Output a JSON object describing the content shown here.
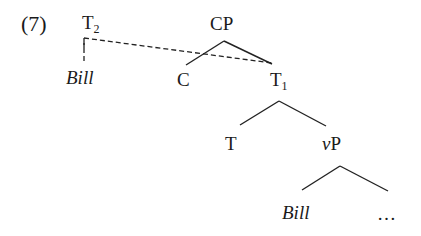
{
  "example_number": "(7)",
  "nodes": {
    "t2": {
      "base": "T",
      "sub": "2"
    },
    "bill_upper": "Bill",
    "cp": "CP",
    "c": "C",
    "t1": {
      "base": "T",
      "sub": "1"
    },
    "t": "T",
    "vp": {
      "v": "v",
      "p": "P"
    },
    "bill_lower": "Bill",
    "ellipsis": "…"
  },
  "edges": [
    {
      "from": "CP",
      "to": "C",
      "style": "solid"
    },
    {
      "from": "CP",
      "to": "T1",
      "style": "solid"
    },
    {
      "from": "T1",
      "to": "T",
      "style": "solid"
    },
    {
      "from": "T1",
      "to": "vP",
      "style": "solid"
    },
    {
      "from": "vP",
      "to": "Bill",
      "style": "solid"
    },
    {
      "from": "vP",
      "to": "…",
      "style": "solid"
    },
    {
      "from": "T2",
      "to": "Bill",
      "style": "dashed"
    },
    {
      "from": "T2",
      "to": "T1",
      "style": "dashed"
    }
  ]
}
